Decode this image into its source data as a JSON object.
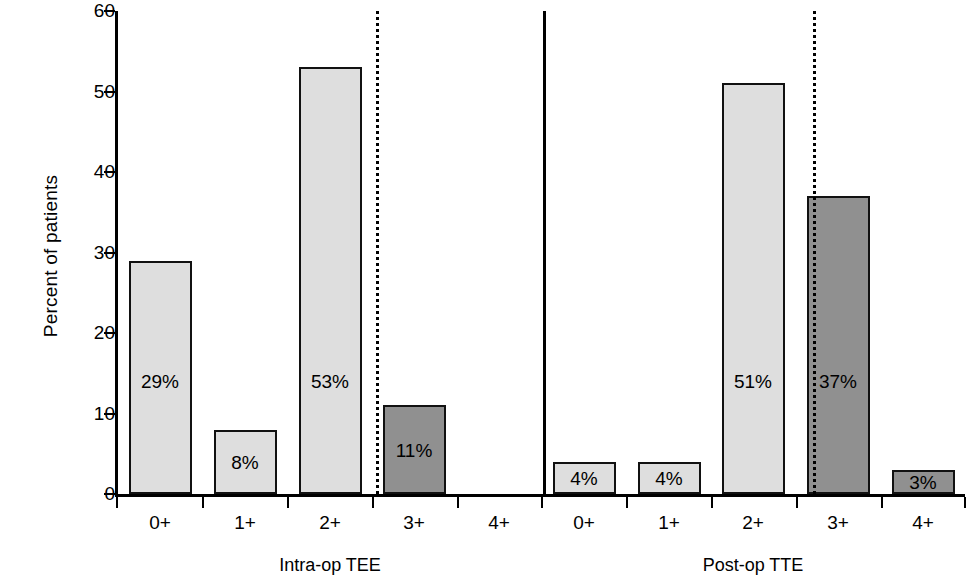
{
  "chart_data": {
    "type": "bar",
    "title": "",
    "subtitle": "",
    "xlabel": "",
    "ylabel": "Percent of patients",
    "ylim": [
      0,
      60
    ],
    "y_ticks": [
      0,
      10,
      20,
      30,
      40,
      50,
      60
    ],
    "y_tick_labels": [
      "0",
      "10",
      "20",
      "30",
      "40",
      "50",
      "60"
    ],
    "grid": false,
    "legend": null,
    "categories": [
      "0+",
      "1+",
      "2+",
      "3+",
      "4+"
    ],
    "groups": [
      {
        "name": "Intra-op TEE",
        "values": [
          29,
          8,
          53,
          11,
          0
        ],
        "data_labels": [
          "29%",
          "8%",
          "53%",
          "11%",
          ""
        ],
        "shades": [
          "light",
          "light",
          "light",
          "dark",
          "light"
        ]
      },
      {
        "name": "Post-op TTE",
        "values": [
          4,
          4,
          51,
          37,
          3
        ],
        "data_labels": [
          "4%",
          "4%",
          "51%",
          "37%",
          "3%"
        ],
        "shades": [
          "light",
          "light",
          "light",
          "dark",
          "dark"
        ]
      }
    ],
    "annotations": [
      {
        "kind": "dotted-vertical-divider",
        "group": "Intra-op TEE",
        "between": [
          "2+",
          "3+"
        ]
      },
      {
        "kind": "solid-vertical-divider",
        "between_groups": [
          "Intra-op TEE",
          "Post-op TTE"
        ]
      },
      {
        "kind": "dotted-vertical-divider",
        "group": "Post-op TTE",
        "between": [
          "2+",
          "3+"
        ]
      }
    ],
    "colors": {
      "light_bar": "#dedede",
      "dark_bar": "#909090",
      "outline": "#111111",
      "axis": "#000000",
      "background": "#ffffff"
    }
  }
}
